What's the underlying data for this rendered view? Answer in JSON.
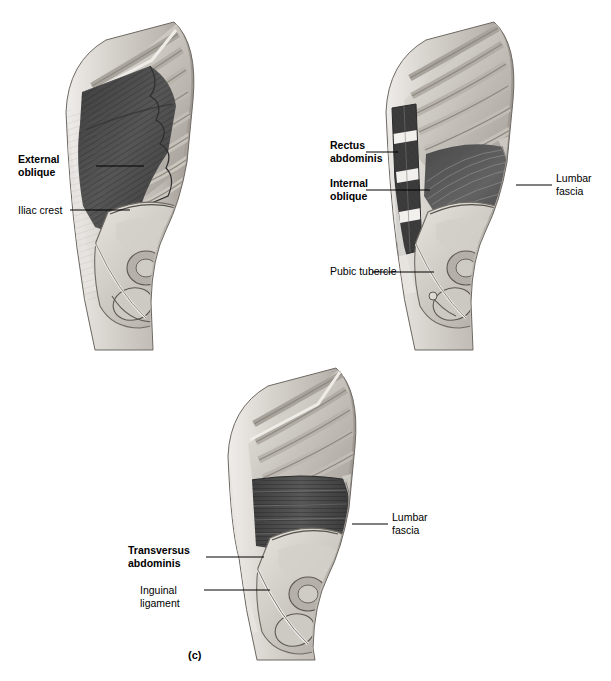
{
  "figure": {
    "caption": "(c)",
    "panels": [
      {
        "id": "panel-a-external-oblique",
        "labels": [
          {
            "name": "external-oblique",
            "text": "External\noblique",
            "bold": true
          },
          {
            "name": "iliac-crest",
            "text": "Iliac crest",
            "bold": false
          }
        ]
      },
      {
        "id": "panel-b-internal-oblique",
        "labels": [
          {
            "name": "rectus-abdominis",
            "text": "Rectus\nabdominis",
            "bold": true
          },
          {
            "name": "internal-oblique",
            "text": "Internal\noblique",
            "bold": true
          },
          {
            "name": "lumbar-fascia",
            "text": "Lumbar\nfascia",
            "bold": false
          },
          {
            "name": "pubic-tubercle",
            "text": "Pubic tubercle",
            "bold": false
          }
        ]
      },
      {
        "id": "panel-c-transversus-abdominis",
        "labels": [
          {
            "name": "transversus-abdominis",
            "text": "Transversus\nabdominis",
            "bold": true
          },
          {
            "name": "lumbar-fascia",
            "text": "Lumbar\nfascia",
            "bold": false
          },
          {
            "name": "inguinal-ligament",
            "text": "Inguinal\nligament",
            "bold": false
          }
        ]
      }
    ]
  },
  "colors": {
    "background": "#ffffff",
    "ink": "#000000",
    "bone_light": "#d9d6d1",
    "bone_mid": "#b9b5ae",
    "bone_shadow": "#8e8a84",
    "muscle_dark": "#4a4a4a",
    "muscle_mid": "#6f6f6f",
    "skin_light": "#cfcbc6"
  }
}
